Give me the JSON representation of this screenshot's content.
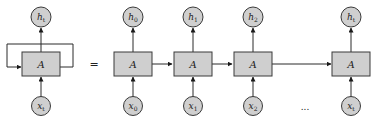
{
  "diagram": {
    "colors": {
      "node_fill": "#cfcfcf",
      "stroke": "#3a3a3a",
      "background": "#ffffff"
    },
    "rolled": {
      "cell_label": "A",
      "input": {
        "base": "x",
        "sub": "t"
      },
      "output": {
        "base": "h",
        "sub": "t"
      }
    },
    "equals_sign": "=",
    "unrolled": [
      {
        "cell_label": "A",
        "input": {
          "base": "x",
          "sub": "0"
        },
        "output": {
          "base": "h",
          "sub": "0"
        }
      },
      {
        "cell_label": "A",
        "input": {
          "base": "x",
          "sub": "1"
        },
        "output": {
          "base": "h",
          "sub": "1"
        }
      },
      {
        "cell_label": "A",
        "input": {
          "base": "x",
          "sub": "2"
        },
        "output": {
          "base": "h",
          "sub": "2"
        }
      },
      {
        "cell_label": "A",
        "input": {
          "base": "x",
          "sub": "t"
        },
        "output": {
          "base": "h",
          "sub": "t"
        }
      }
    ],
    "ellipsis": "..."
  }
}
